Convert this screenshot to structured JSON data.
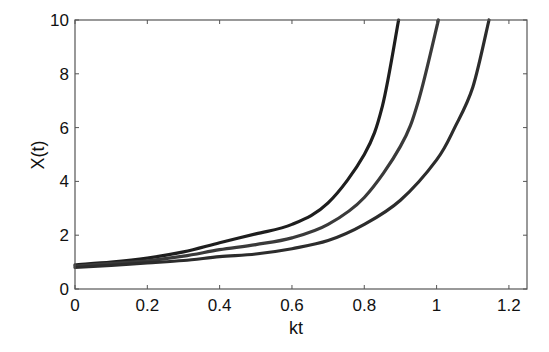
{
  "chart_data": {
    "type": "line",
    "title": "",
    "xlabel": "kt",
    "ylabel": "X(t)",
    "xlim": [
      0,
      1.25
    ],
    "ylim": [
      0,
      10
    ],
    "xticks": [
      0,
      0.2,
      0.4,
      0.6,
      0.8,
      1,
      1.2
    ],
    "xtick_labels": [
      "0",
      "0.2",
      "0.4",
      "0.6",
      "0.8",
      "1",
      "1.2"
    ],
    "yticks": [
      0,
      2,
      4,
      6,
      8,
      10
    ],
    "ytick_labels": [
      "0",
      "2",
      "4",
      "6",
      "8",
      "10"
    ],
    "grid": false,
    "legend": null,
    "series": [
      {
        "name": "curve-1",
        "color": "#1e1e1e",
        "x": [
          0,
          0.1,
          0.2,
          0.3,
          0.4,
          0.5,
          0.6,
          0.7,
          0.8,
          0.85,
          0.895
        ],
        "y": [
          0.9,
          1.0,
          1.15,
          1.38,
          1.72,
          2.05,
          2.4,
          3.2,
          5.0,
          6.8,
          10
        ]
      },
      {
        "name": "curve-2",
        "color": "#3a3a3a",
        "x": [
          0,
          0.1,
          0.2,
          0.3,
          0.4,
          0.5,
          0.6,
          0.7,
          0.8,
          0.9,
          0.95,
          1.005
        ],
        "y": [
          0.85,
          0.95,
          1.05,
          1.22,
          1.46,
          1.65,
          1.9,
          2.4,
          3.4,
          5.3,
          7.0,
          10
        ]
      },
      {
        "name": "curve-3",
        "color": "#2c2c2c",
        "x": [
          0,
          0.1,
          0.2,
          0.3,
          0.4,
          0.5,
          0.6,
          0.7,
          0.8,
          0.9,
          1.0,
          1.05,
          1.1,
          1.145
        ],
        "y": [
          0.8,
          0.88,
          0.97,
          1.06,
          1.2,
          1.3,
          1.5,
          1.8,
          2.4,
          3.3,
          4.8,
          6.0,
          7.5,
          10
        ]
      }
    ]
  }
}
